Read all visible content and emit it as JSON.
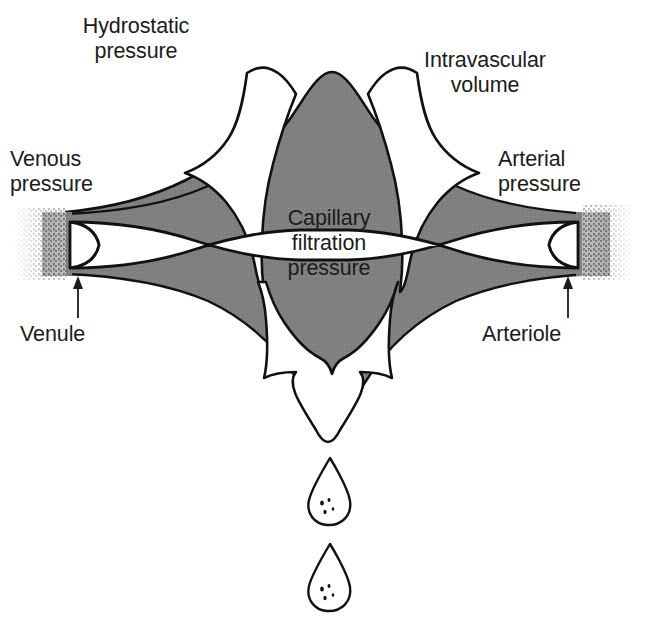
{
  "figure": {
    "title": "Capillary filtration pressure",
    "kind": "anatomical-schematic-diagram",
    "colors": {
      "background": "#ffffff",
      "tissue_gray": "#808080",
      "outline_black": "#111111",
      "text_black": "#1b1b1b"
    }
  },
  "labels": {
    "hydrostatic_pressure": "Hydrostatic\npressure",
    "intravascular_volume": "Intravascular\nvolume",
    "venous_pressure": "Venous\npressure",
    "arterial_pressure": "Arterial\npressure",
    "capillary_filtration_pressure": "Capillary\nfiltration\npressure",
    "venule": "Venule",
    "arteriole": "Arteriole"
  },
  "elements": {
    "arrow_upper_left": "hydrostatic-pressure-arrow",
    "arrow_upper_right": "intravascular-volume-arrow",
    "arrow_down": "filtration-outflow-arrow",
    "leader_arrow_left": "venule-leader-arrow",
    "leader_arrow_right": "arteriole-leader-arrow",
    "vessel_left": "venule-vessel",
    "vessel_right": "arteriole-vessel",
    "capillary_lumen": "capillary-lumen",
    "droplets": [
      "fluid-droplet-upper",
      "fluid-droplet-lower"
    ]
  }
}
